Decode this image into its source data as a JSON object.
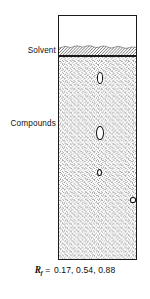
{
  "figure": {
    "type": "tlc-plate-diagram",
    "width": 150,
    "height": 299
  },
  "labels": {
    "solvent": "Solvent",
    "compounds": "Compounds"
  },
  "plate": {
    "border_color": "#1a1a1a",
    "adsorbent_color": "#fdfdfd",
    "stipple_color": "#8a8a8a",
    "headspace_color": "#ffffff",
    "solvent_front_line_color": "#1a1a1a",
    "bounds": {
      "x": 58,
      "y": 15,
      "width": 79,
      "height": 245
    },
    "solvent_front_y": 55,
    "baseline_y": 260
  },
  "spots": [
    {
      "id": "spot-1",
      "name": "compound-spot-top",
      "x": 100,
      "y": 78,
      "width": 6.5,
      "height": 11.5
    },
    {
      "id": "spot-2",
      "name": "compound-spot-middle",
      "x": 100,
      "y": 133,
      "width": 7.5,
      "height": 14.5
    },
    {
      "id": "spot-3",
      "name": "compound-spot-lower",
      "x": 99,
      "y": 172,
      "width": 5.0,
      "height": 7.0
    },
    {
      "id": "spot-4",
      "name": "compound-spot-origin",
      "x": 133,
      "y": 200,
      "width": 6.5,
      "height": 5.5
    }
  ],
  "caption": {
    "symbol": "R",
    "subscript": "f",
    "equals": " = ",
    "values_text": "0.17, 0.54, 0.88",
    "values": [
      0.17,
      0.54,
      0.88
    ]
  },
  "chart_data": {
    "type": "scatter",
    "xlabel": "",
    "ylabel": "Retention factor (Rf)",
    "ylim": [
      0,
      1
    ],
    "categories": [
      "0.17",
      "0.54",
      "0.88"
    ],
    "values": [
      0.17,
      0.54,
      0.88
    ],
    "annotations": [
      "Solvent",
      "Compounds",
      "Rf = 0.17, 0.54, 0.88"
    ]
  }
}
